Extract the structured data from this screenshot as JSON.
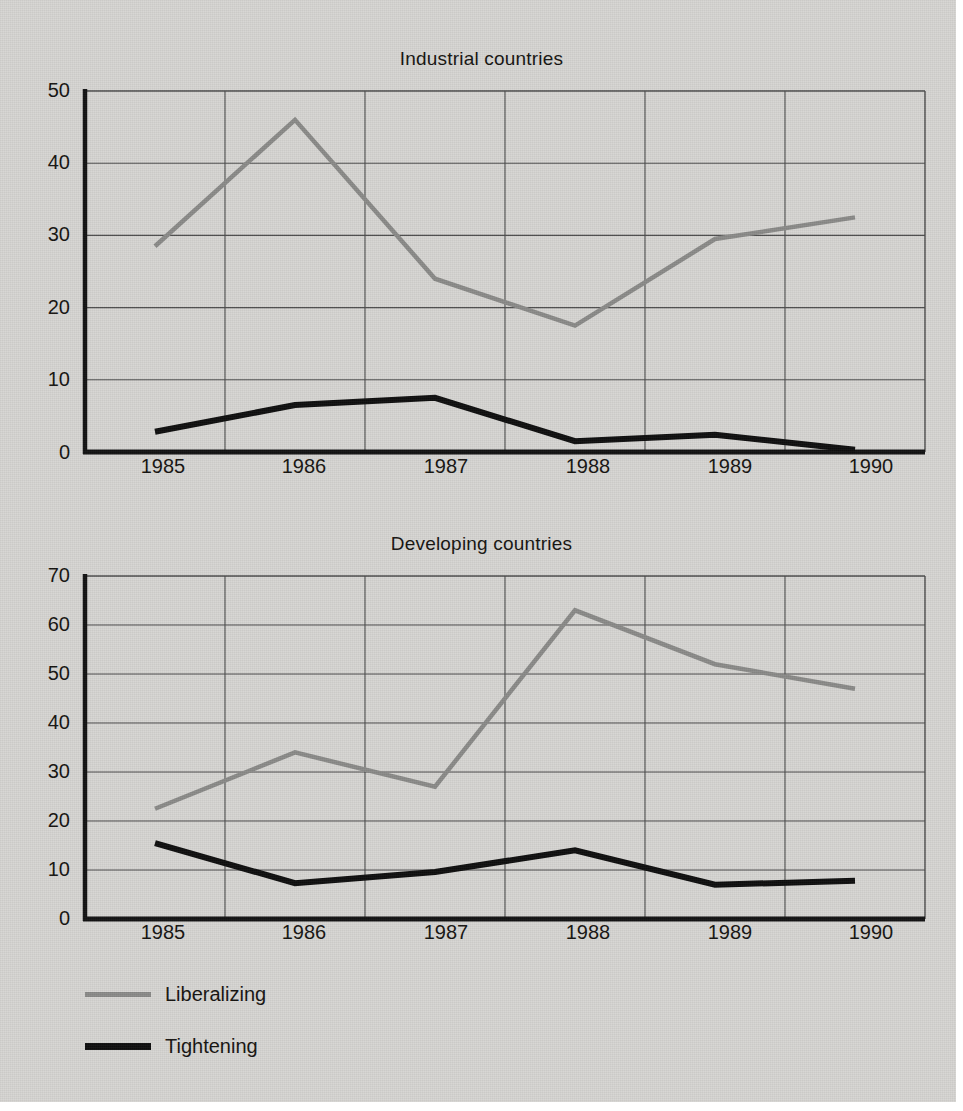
{
  "legend": {
    "items": [
      {
        "label": "Liberalizing",
        "color": "#8a8a88",
        "key": "liberalizing"
      },
      {
        "label": "Tightening",
        "color": "#0d0d0d",
        "key": "tightening"
      }
    ]
  },
  "chart_data": [
    {
      "type": "line",
      "title": "Industrial countries",
      "xlabel": "",
      "ylabel": "",
      "x": [
        "1985",
        "1986",
        "1987",
        "1988",
        "1989",
        "1990"
      ],
      "categories": [
        "1985",
        "1986",
        "1987",
        "1988",
        "1989",
        "1990"
      ],
      "ylim": [
        0,
        50
      ],
      "yticks": [
        0,
        10,
        20,
        30,
        40,
        50
      ],
      "grid": true,
      "legend_position": "below-figure",
      "series": [
        {
          "name": "Liberalizing",
          "color": "#8a8a88",
          "values": [
            28.5,
            46,
            24,
            17.5,
            29.5,
            32.5
          ]
        },
        {
          "name": "Tightening",
          "color": "#0d0d0d",
          "values": [
            2.8,
            6.5,
            7.5,
            1.5,
            2.4,
            0.3
          ]
        }
      ]
    },
    {
      "type": "line",
      "title": "Developing countries",
      "xlabel": "",
      "ylabel": "",
      "x": [
        "1985",
        "1986",
        "1987",
        "1988",
        "1989",
        "1990"
      ],
      "categories": [
        "1985",
        "1986",
        "1987",
        "1988",
        "1989",
        "1990"
      ],
      "ylim": [
        0,
        70
      ],
      "yticks": [
        0,
        10,
        20,
        30,
        40,
        50,
        60,
        70
      ],
      "grid": true,
      "legend_position": "below-figure",
      "series": [
        {
          "name": "Liberalizing",
          "color": "#8a8a88",
          "values": [
            22.5,
            34,
            27,
            63,
            52,
            47
          ]
        },
        {
          "name": "Tightening",
          "color": "#0d0d0d",
          "values": [
            15.5,
            7.3,
            9.6,
            14,
            7,
            7.8
          ]
        }
      ]
    }
  ]
}
